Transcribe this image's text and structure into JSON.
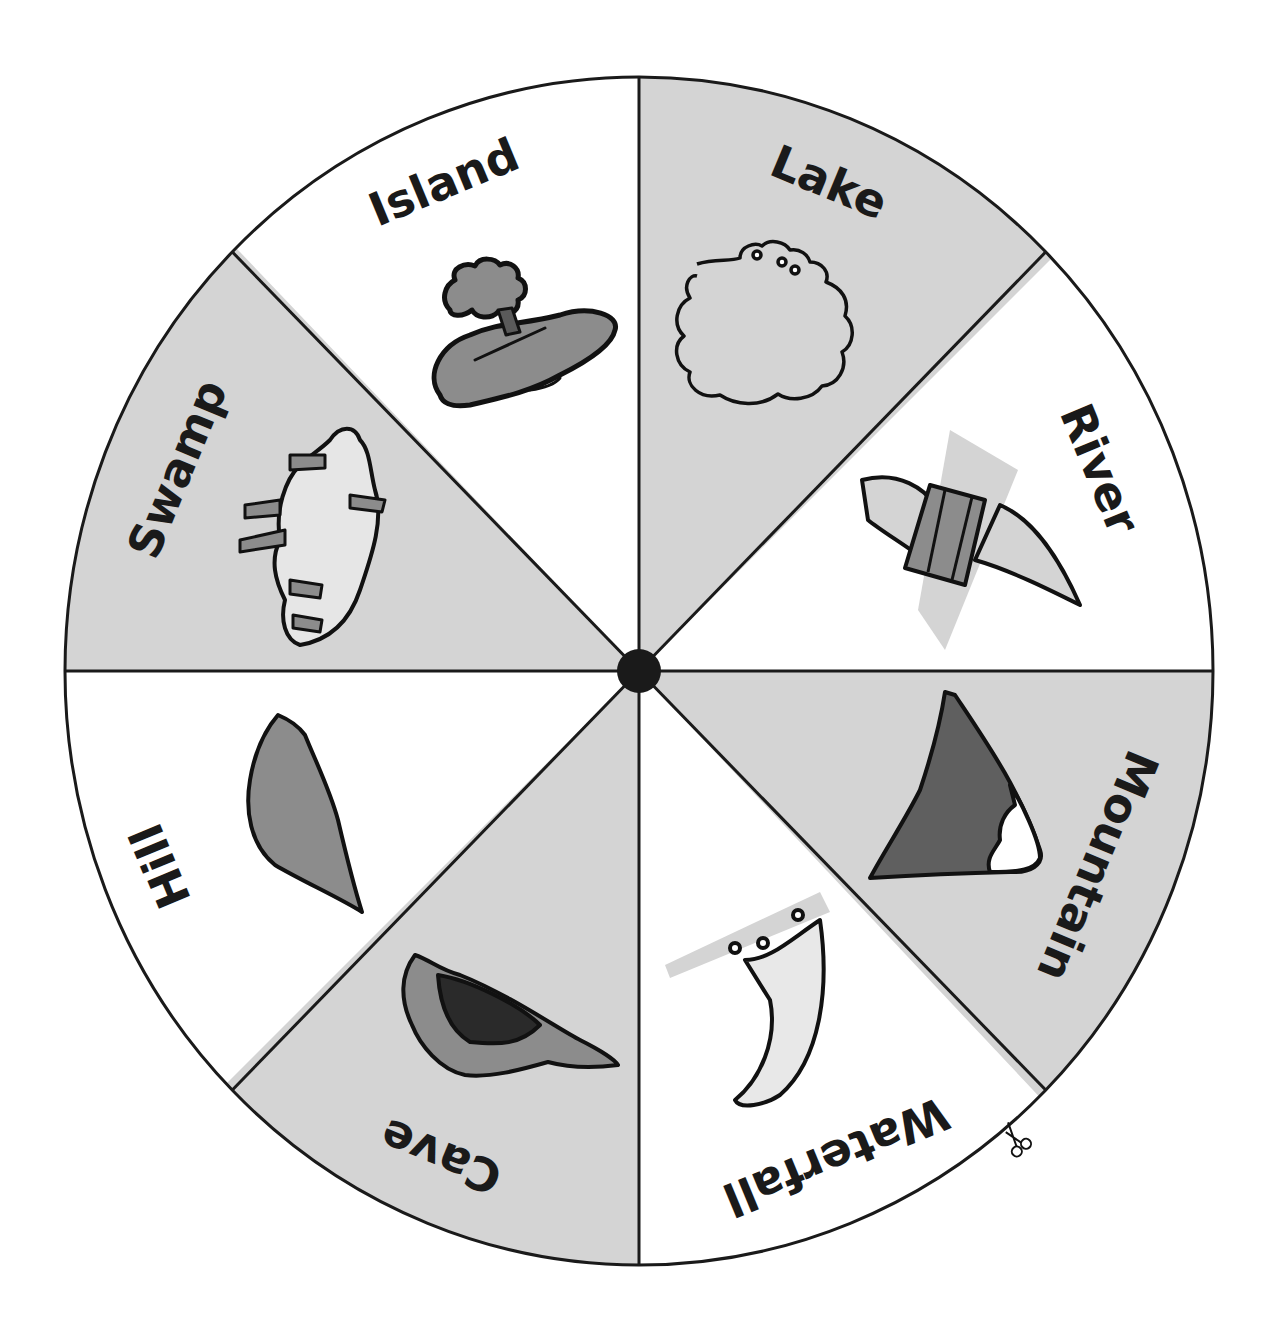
{
  "wheel": {
    "center": [
      639,
      671
    ],
    "radius_x": 574,
    "radius_y": 594,
    "colors": {
      "shaded": "#d4d4d4",
      "plain": "#ffffff",
      "outline": "#1a1a1a",
      "hub": "#1a1a1a",
      "illustration_mid": "#8c8c8c",
      "illustration_dark": "#5a5a5a"
    },
    "sectors": [
      {
        "label": "Lake",
        "shaded": true,
        "icon": "lake-icon"
      },
      {
        "label": "River",
        "shaded": false,
        "icon": "river-icon"
      },
      {
        "label": "Mountain",
        "shaded": true,
        "icon": "mountain-icon"
      },
      {
        "label": "Waterfall",
        "shaded": false,
        "icon": "waterfall-icon"
      },
      {
        "label": "Cave",
        "shaded": true,
        "icon": "cave-icon"
      },
      {
        "label": "Hill",
        "shaded": false,
        "icon": "hill-icon"
      },
      {
        "label": "Swamp",
        "shaded": true,
        "icon": "swamp-icon"
      },
      {
        "label": "Island",
        "shaded": false,
        "icon": "island-icon"
      }
    ]
  },
  "cut_marker": {
    "icon": "scissors-icon"
  }
}
